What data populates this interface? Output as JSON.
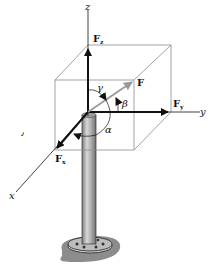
{
  "diagram": {
    "type": "3d-force-vector",
    "axes": {
      "x": "x",
      "y": "y",
      "z": "z"
    },
    "force": "F",
    "components": {
      "fx": "F",
      "fx_sub": "x",
      "fy": "F",
      "fy_sub": "y",
      "fz": "F",
      "fz_sub": "z"
    },
    "angles": {
      "alpha": "α",
      "beta": "β",
      "gamma": "γ"
    },
    "stray_mark": "٫",
    "colors": {
      "line": "#111111",
      "box": "#8a8a8a",
      "force": "#9a9a9a",
      "post": "#a8a8a8",
      "base": "#8c8c8c"
    }
  }
}
